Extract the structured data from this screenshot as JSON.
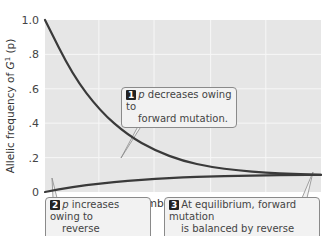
{
  "chart_data": {
    "type": "line",
    "title": "",
    "xlabel": "Number of generations",
    "ylabel": "Allelic frequency of G¹ (p)",
    "ylabel_parts": {
      "prefix": "Allelic frequency of ",
      "symbol": "G",
      "sup": "1",
      "suffix": " (p)"
    },
    "ylim": [
      0,
      1.0
    ],
    "xlim": [
      0,
      1
    ],
    "ytick_labels": [
      "0",
      ".2",
      ".4",
      ".6",
      ".8",
      "1.0"
    ],
    "yticks": [
      0,
      0.2,
      0.4,
      0.6,
      0.8,
      1.0
    ],
    "xtick_labels": [],
    "grid": true,
    "equilibrium": 0.1,
    "series": [
      {
        "name": "p decreasing (forward mutation)",
        "start": 1.0,
        "end": 0.1,
        "x": [
          0,
          0.1,
          0.2,
          0.3,
          0.4,
          0.5,
          0.6,
          0.7,
          0.8,
          0.9,
          1.0
        ],
        "y": [
          1.0,
          0.68,
          0.47,
          0.33,
          0.24,
          0.18,
          0.145,
          0.125,
          0.112,
          0.105,
          0.1
        ]
      },
      {
        "name": "p increasing (reverse mutation)",
        "start": 0.0,
        "end": 0.1,
        "x": [
          0,
          0.1,
          0.2,
          0.3,
          0.4,
          0.5,
          0.6,
          0.7,
          0.8,
          0.9,
          1.0
        ],
        "y": [
          0.0,
          0.03,
          0.05,
          0.065,
          0.077,
          0.085,
          0.09,
          0.094,
          0.097,
          0.099,
          0.1
        ]
      }
    ],
    "colors": {
      "line": "#3a3a3a",
      "plot_bg": "#e6e6e6",
      "grid": "#f7f7f7"
    },
    "annotations": [
      {
        "number": "1",
        "symbol": "p",
        "text": " decreases owing to",
        "text2": "forward mutation."
      },
      {
        "number": "2",
        "symbol": "p",
        "text": " increases owing to",
        "text2": "reverse mutation."
      },
      {
        "number": "3",
        "symbol": "",
        "text": "At equilibrium, forward mutation",
        "text2": "is balanced by reverse mutation."
      }
    ]
  }
}
